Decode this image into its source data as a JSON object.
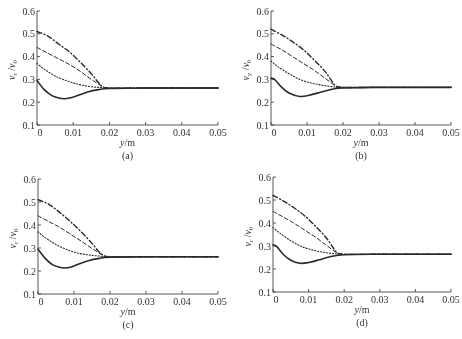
{
  "chart_data": [
    {
      "panel": "(a)",
      "type": "line",
      "xlabel": "y/m",
      "ylabel": "v_r/v_0",
      "ylabel_main": "v",
      "ylabel_sub": "r",
      "ylabel_den": "v",
      "ylabel_den_sub": "0",
      "xlim": [
        0,
        0.05
      ],
      "ylim": [
        0.1,
        0.6
      ],
      "xticks": [
        "0",
        "0.01",
        "0.02",
        "0.03",
        "0.04",
        "0.05"
      ],
      "yticks": [
        "0.1",
        "0.2",
        "0.3",
        "0.4",
        "0.5",
        "0.6"
      ],
      "grid": false,
      "caption": "(a)",
      "layout": {
        "ox": 37,
        "oy": 125,
        "x1": 218,
        "y1": 11
      },
      "series": [
        {
          "name": "dash-dot",
          "style": "dashdot",
          "x": [
            0,
            0.003,
            0.006,
            0.009,
            0.012,
            0.015,
            0.017,
            0.018,
            0.02,
            0.03,
            0.04,
            0.05
          ],
          "values": [
            0.51,
            0.49,
            0.455,
            0.42,
            0.375,
            0.325,
            0.285,
            0.27,
            0.262,
            0.262,
            0.262,
            0.262
          ]
        },
        {
          "name": "dashed",
          "style": "dashed",
          "x": [
            0,
            0.003,
            0.006,
            0.009,
            0.012,
            0.015,
            0.018,
            0.02,
            0.03,
            0.04,
            0.05
          ],
          "values": [
            0.44,
            0.415,
            0.39,
            0.365,
            0.335,
            0.3,
            0.27,
            0.262,
            0.262,
            0.262,
            0.262
          ]
        },
        {
          "name": "dotted",
          "style": "dotted",
          "x": [
            0,
            0.002,
            0.005,
            0.008,
            0.011,
            0.014,
            0.017,
            0.02,
            0.03,
            0.04,
            0.05
          ],
          "values": [
            0.37,
            0.345,
            0.315,
            0.295,
            0.28,
            0.27,
            0.265,
            0.262,
            0.262,
            0.262,
            0.262
          ]
        },
        {
          "name": "solid",
          "style": "solid",
          "x": [
            0,
            0.002,
            0.004,
            0.006,
            0.0075,
            0.009,
            0.011,
            0.014,
            0.017,
            0.02,
            0.03,
            0.04,
            0.05
          ],
          "values": [
            0.295,
            0.255,
            0.23,
            0.218,
            0.215,
            0.218,
            0.228,
            0.245,
            0.255,
            0.26,
            0.262,
            0.262,
            0.262
          ]
        }
      ]
    },
    {
      "panel": "(b)",
      "type": "line",
      "xlabel": "y/m",
      "ylabel": "v_y/v_0",
      "ylabel_main": "v",
      "ylabel_sub": "y",
      "ylabel_den": "v",
      "ylabel_den_sub": "0",
      "xlim": [
        0,
        0.05
      ],
      "ylim": [
        0.1,
        0.6
      ],
      "xticks": [
        "0",
        "0.01",
        "0.02",
        "0.03",
        "0.04",
        "0.05"
      ],
      "yticks": [
        "0.1",
        "0.2",
        "0.3",
        "0.4",
        "0.5",
        "0.6"
      ],
      "grid": false,
      "caption": "(b)",
      "layout": {
        "ox": 271,
        "oy": 125,
        "x1": 451,
        "y1": 11
      },
      "series": [
        {
          "name": "dash-dot",
          "style": "dashdot",
          "x": [
            0,
            0.003,
            0.006,
            0.009,
            0.012,
            0.015,
            0.017,
            0.018,
            0.02,
            0.03,
            0.04,
            0.05
          ],
          "values": [
            0.52,
            0.495,
            0.465,
            0.43,
            0.385,
            0.335,
            0.29,
            0.272,
            0.265,
            0.265,
            0.265,
            0.265
          ]
        },
        {
          "name": "dashed",
          "style": "dashed",
          "x": [
            0,
            0.003,
            0.006,
            0.009,
            0.012,
            0.015,
            0.018,
            0.02,
            0.03,
            0.04,
            0.05
          ],
          "values": [
            0.455,
            0.43,
            0.4,
            0.37,
            0.34,
            0.305,
            0.272,
            0.265,
            0.265,
            0.265,
            0.265
          ]
        },
        {
          "name": "dotted",
          "style": "dotted",
          "x": [
            0,
            0.002,
            0.005,
            0.008,
            0.011,
            0.014,
            0.017,
            0.02,
            0.03,
            0.04,
            0.05
          ],
          "values": [
            0.38,
            0.355,
            0.325,
            0.3,
            0.285,
            0.275,
            0.268,
            0.265,
            0.265,
            0.265,
            0.265
          ]
        },
        {
          "name": "solid",
          "style": "solid",
          "x": [
            0,
            0.001,
            0.003,
            0.005,
            0.008,
            0.011,
            0.014,
            0.017,
            0.02,
            0.03,
            0.04,
            0.05
          ],
          "values": [
            0.305,
            0.3,
            0.265,
            0.24,
            0.225,
            0.232,
            0.245,
            0.257,
            0.263,
            0.265,
            0.265,
            0.265
          ]
        }
      ]
    },
    {
      "panel": "(c)",
      "type": "line",
      "xlabel": "y/m",
      "ylabel": "v_r/v_0",
      "ylabel_main": "v",
      "ylabel_sub": "r",
      "ylabel_den": "v",
      "ylabel_den_sub": "0",
      "xlim": [
        0,
        0.05
      ],
      "ylim": [
        0.1,
        0.6
      ],
      "xticks": [
        "0",
        "0.01",
        "0.02",
        "0.03",
        "0.04",
        "0.05"
      ],
      "yticks": [
        "0.1",
        "0.2",
        "0.3",
        "0.4",
        "0.5",
        "0.6"
      ],
      "grid": false,
      "caption": "(c)",
      "layout": {
        "ox": 38,
        "oy": 294,
        "x1": 218,
        "y1": 179
      },
      "series": [
        {
          "name": "dash-dot",
          "style": "dashdot",
          "x": [
            0,
            0.003,
            0.006,
            0.009,
            0.012,
            0.015,
            0.017,
            0.018,
            0.02,
            0.03,
            0.04,
            0.05
          ],
          "values": [
            0.51,
            0.49,
            0.455,
            0.415,
            0.37,
            0.32,
            0.282,
            0.27,
            0.262,
            0.262,
            0.262,
            0.262
          ]
        },
        {
          "name": "dashed",
          "style": "dashed",
          "x": [
            0,
            0.003,
            0.006,
            0.009,
            0.012,
            0.015,
            0.018,
            0.02,
            0.03,
            0.04,
            0.05
          ],
          "values": [
            0.44,
            0.415,
            0.39,
            0.36,
            0.33,
            0.298,
            0.27,
            0.262,
            0.262,
            0.262,
            0.262
          ]
        },
        {
          "name": "dotted",
          "style": "dotted",
          "x": [
            0,
            0.002,
            0.005,
            0.008,
            0.011,
            0.014,
            0.017,
            0.02,
            0.03,
            0.04,
            0.05
          ],
          "values": [
            0.37,
            0.345,
            0.315,
            0.293,
            0.278,
            0.27,
            0.265,
            0.262,
            0.262,
            0.262,
            0.262
          ]
        },
        {
          "name": "solid",
          "style": "solid",
          "x": [
            0,
            0.002,
            0.004,
            0.006,
            0.0072,
            0.009,
            0.011,
            0.014,
            0.017,
            0.02,
            0.03,
            0.04,
            0.05
          ],
          "values": [
            0.295,
            0.255,
            0.228,
            0.216,
            0.213,
            0.216,
            0.228,
            0.245,
            0.255,
            0.26,
            0.262,
            0.262,
            0.262
          ]
        }
      ]
    },
    {
      "panel": "(d)",
      "type": "line",
      "xlabel": "y/m",
      "ylabel": "v_r/v_0",
      "ylabel_main": "v",
      "ylabel_sub": "r",
      "ylabel_den": "v",
      "ylabel_den_sub": "0",
      "xlim": [
        0,
        0.05
      ],
      "ylim": [
        0.1,
        0.6
      ],
      "xticks": [
        "0",
        "0.01",
        "0.02",
        "0.03",
        "0.04",
        "0.05"
      ],
      "yticks": [
        "0.1",
        "0.2",
        "0.3",
        "0.4",
        "0.5",
        "0.6"
      ],
      "grid": false,
      "caption": "(d)",
      "layout": {
        "ox": 273,
        "oy": 292,
        "x1": 451,
        "y1": 177
      },
      "series": [
        {
          "name": "dash-dot",
          "style": "dashdot",
          "x": [
            0,
            0.003,
            0.006,
            0.009,
            0.012,
            0.015,
            0.017,
            0.018,
            0.02,
            0.03,
            0.04,
            0.05
          ],
          "values": [
            0.52,
            0.495,
            0.465,
            0.43,
            0.385,
            0.335,
            0.29,
            0.272,
            0.264,
            0.264,
            0.264,
            0.264
          ]
        },
        {
          "name": "dashed",
          "style": "dashed",
          "x": [
            0,
            0.003,
            0.006,
            0.009,
            0.012,
            0.015,
            0.018,
            0.02,
            0.03,
            0.04,
            0.05
          ],
          "values": [
            0.45,
            0.425,
            0.398,
            0.368,
            0.338,
            0.303,
            0.27,
            0.264,
            0.264,
            0.264,
            0.264
          ]
        },
        {
          "name": "dotted",
          "style": "dotted",
          "x": [
            0,
            0.002,
            0.005,
            0.008,
            0.011,
            0.014,
            0.017,
            0.02,
            0.03,
            0.04,
            0.05
          ],
          "values": [
            0.38,
            0.355,
            0.323,
            0.298,
            0.283,
            0.273,
            0.267,
            0.264,
            0.264,
            0.264,
            0.264
          ]
        },
        {
          "name": "solid",
          "style": "solid",
          "x": [
            0,
            0.001,
            0.003,
            0.005,
            0.0075,
            0.01,
            0.013,
            0.016,
            0.02,
            0.03,
            0.04,
            0.05
          ],
          "values": [
            0.305,
            0.298,
            0.262,
            0.238,
            0.225,
            0.228,
            0.24,
            0.253,
            0.262,
            0.264,
            0.264,
            0.264
          ]
        }
      ]
    }
  ]
}
